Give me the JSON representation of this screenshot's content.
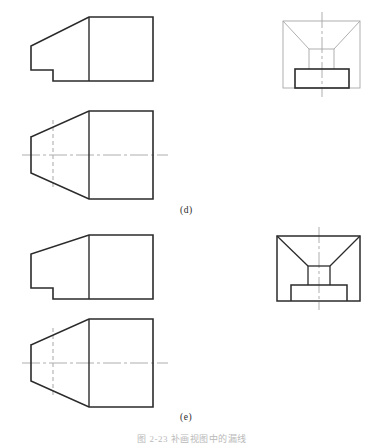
{
  "page": {
    "background_color": "#ffffff",
    "width": 384,
    "height": 441
  },
  "figures": [
    {
      "id": "d",
      "label": "(d)",
      "views": [
        "front-view",
        "top-view",
        "side-view"
      ]
    },
    {
      "id": "e",
      "label": "(e)",
      "views": [
        "front-view",
        "top-view",
        "side-view"
      ]
    }
  ],
  "caption": {
    "text": "图 2-23  补画视图中的漏线"
  },
  "styles": {
    "visible_line_color": "#2b2b2b",
    "light_line_color": "#9a9a9a",
    "hidden_line_color": "#b0b0b0",
    "center_line_color": "#9a9a9a",
    "visible_line_width": "1.6",
    "light_line_width": "0.8",
    "hidden_line_width": "1.0",
    "center_line_width": "0.8"
  },
  "geometry": {
    "fig_d": {
      "front_view": {
        "name": "front-view-d",
        "outline": "31,56 31,46 89,17 153,17 153,81 53,81 53,70 31,70 31,56",
        "vertical_divider": "89,17 89,81"
      },
      "top_view": {
        "name": "top-view-d",
        "outline": "31,137 89,111 153,111 153,199 89,199 31,173 31,137",
        "vertical_divider": "89,111 89,199",
        "hidden_line": "53,120 53,190",
        "center_line": "22,155 168,155"
      },
      "side_view": {
        "name": "side-view-d",
        "rect": "283,21 360,21 360,88 283,88 283,21",
        "trapezoid_left": "283,21 309,49",
        "trapezoid_right": "360,21 334,49",
        "trapezoid_top": "309,49 334,49",
        "inner_left": "309,49 309,69",
        "inner_right": "334,49 334,69",
        "base_rect": "295,69 349,69 349,88 295,88 295,69",
        "center_line_v": "322,13 322,96"
      }
    },
    "fig_e": {
      "front_view": {
        "name": "front-view-e",
        "outline": "31,264 31,254 89,235 153,235 153,299 53,299 53,288 31,288 31,264",
        "vertical_divider": "89,235 89,299"
      },
      "top_view": {
        "name": "top-view-e",
        "outline": "31,345 89,319 153,319 153,407 89,407 31,381 31,345",
        "vertical_divider": "89,319 89,407",
        "hidden_line": "53,328 53,398",
        "center_line": "22,363 168,363"
      },
      "side_view": {
        "name": "side-view-e",
        "rect": "277,236 360,236 360,301 277,301 277,236",
        "trapezoid_left": "277,236 308,266",
        "trapezoid_right": "360,236 330,266",
        "trapezoid_top": "308,266 330,266",
        "inner_left": "308,266 308,285",
        "inner_right": "330,266 330,285",
        "base_rect": "291,285 347,285 347,301 291,301 291,285",
        "center_line_v": "319,228 319,309"
      }
    }
  }
}
